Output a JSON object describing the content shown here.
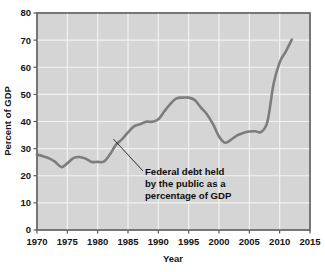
{
  "chart_data": {
    "type": "line",
    "title": "",
    "subtitle": "",
    "xlabel": "Year",
    "ylabel": "Percent of GDP",
    "xlim": [
      1970,
      2015
    ],
    "ylim": [
      0,
      80
    ],
    "grid": true,
    "legend": "none",
    "xticks": [
      "1970",
      "1975",
      "1980",
      "1985",
      "1990",
      "1995",
      "2000",
      "2005",
      "2010",
      "2015"
    ],
    "yticks": [
      "0",
      "10",
      "20",
      "30",
      "40",
      "50",
      "60",
      "70",
      "80"
    ],
    "annotations": [
      {
        "line1": "Federal debt held",
        "line2": "by the public as a",
        "line3": "percentage of GDP",
        "points_to_x": 1982.6,
        "points_to_y": 33.5
      }
    ],
    "series": [
      {
        "name": "Federal debt held by the public as a percentage of GDP",
        "color": "#7d7d7d",
        "x": [
          1970,
          1971,
          1972,
          1973,
          1974,
          1975,
          1976,
          1977,
          1978,
          1979,
          1980,
          1981,
          1982,
          1983,
          1984,
          1985,
          1986,
          1987,
          1988,
          1989,
          1990,
          1991,
          1992,
          1993,
          1994,
          1995,
          1996,
          1997,
          1998,
          1999,
          2000,
          2001,
          2002,
          2003,
          2004,
          2005,
          2006,
          2007,
          2008,
          2009,
          2010,
          2011,
          2012
        ],
        "values": [
          27.8,
          27.2,
          26.4,
          25.1,
          23.2,
          24.6,
          26.5,
          26.9,
          26.3,
          25.1,
          25.1,
          25.2,
          27.8,
          31.4,
          33.4,
          36.0,
          38.2,
          39.0,
          39.9,
          39.9,
          40.8,
          43.8,
          46.5,
          48.5,
          48.8,
          48.8,
          47.9,
          45.2,
          42.7,
          39.1,
          34.5,
          32.2,
          33.3,
          34.9,
          35.8,
          36.3,
          36.4,
          36.2,
          40.1,
          53.9,
          61.8,
          65.8,
          70.2
        ]
      }
    ]
  },
  "axes": {
    "y_title": "Percent of GDP",
    "x_title": "Year"
  }
}
